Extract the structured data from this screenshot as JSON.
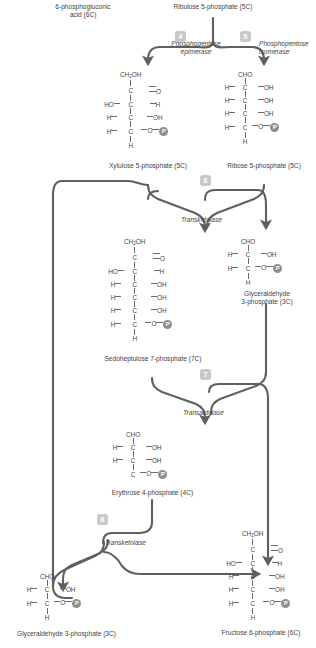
{
  "diagram": {
    "line_color": "#5f5f5f",
    "badge_color": "#c9c9c9",
    "phosphate_color": "#8d8d8d",
    "text_color": "#3f3f3f"
  },
  "labels": {
    "six_phosphogluconic": "6-phosphogluconic\nacid (6C)",
    "six_phosphogluconic_l1": "6-phosphogluconic",
    "six_phosphogluconic_l2": "acid (6C)",
    "ribulose5p": "Ribulose 5-phosphate (5C)",
    "xylulose5p": "Xylulose 5-phosphate (5C)",
    "ribose5p": "Ribose 5-phosphate (5C)",
    "sedoheptulose7p": "Sedoheptulose 7-phosphate (7C)",
    "glyceraldehyde3p_l1": "Glyceraldehyde",
    "glyceraldehyde3p_l2": "3-phosphate (3C)",
    "erythrose4p": "Erythrose 4-phosphate (4C)",
    "glyceraldehyde3p_bottom": "Glyceraldehyde 3-phosphate (3C)",
    "fructose6p": "Fructose 6-phosphate (6C)"
  },
  "enzymes": {
    "step4_l1": "Phosphopentose",
    "step4_l2": "epimerase",
    "step5_l1": "Phosphopentose",
    "step5_l2": "isomerase",
    "step6": "Transketolase",
    "step7": "Transaldolase",
    "step8": "Transketolase"
  },
  "badges": [
    {
      "num": "4",
      "x": 175,
      "y": 31
    },
    {
      "num": "5",
      "x": 240,
      "y": 31
    },
    {
      "num": "6",
      "x": 200,
      "y": 175
    },
    {
      "num": "7",
      "x": 200,
      "y": 369
    },
    {
      "num": "8",
      "x": 97,
      "y": 514
    }
  ],
  "phosphate_glyph": "P",
  "molecules": {
    "xylulose5p": {
      "name": "Xylulose 5-phosphate (5C)",
      "carbons": 5,
      "rows": [
        {
          "left": "",
          "center": "CH2OH",
          "right": "",
          "type": "head"
        },
        {
          "left": "",
          "center": "C",
          "right": "O",
          "bond": "double"
        },
        {
          "left": "HO",
          "center": "C",
          "right": "H",
          "bond": "single"
        },
        {
          "left": "H",
          "center": "C",
          "right": "OH",
          "bond": "single"
        },
        {
          "left": "H",
          "center": "C",
          "right": "O-P",
          "bond": "single"
        },
        {
          "left": "",
          "center": "H",
          "right": "",
          "type": "tail"
        }
      ]
    },
    "ribose5p": {
      "name": "Ribose 5-phosphate (5C)",
      "carbons": 5,
      "rows": [
        {
          "left": "",
          "center": "CHO",
          "right": "",
          "type": "head"
        },
        {
          "left": "H",
          "center": "C",
          "right": "OH",
          "bond": "single"
        },
        {
          "left": "H",
          "center": "C",
          "right": "OH",
          "bond": "single"
        },
        {
          "left": "H",
          "center": "C",
          "right": "OH",
          "bond": "single"
        },
        {
          "left": "H",
          "center": "C",
          "right": "O-P",
          "bond": "single"
        },
        {
          "left": "",
          "center": "H",
          "right": "",
          "type": "tail"
        }
      ]
    },
    "sedoheptulose7p": {
      "name": "Sedoheptulose 7-phosphate (7C)",
      "carbons": 7,
      "rows": [
        {
          "left": "",
          "center": "CH2OH",
          "right": "",
          "type": "head"
        },
        {
          "left": "",
          "center": "C",
          "right": "O",
          "bond": "double"
        },
        {
          "left": "HO",
          "center": "C",
          "right": "H",
          "bond": "single"
        },
        {
          "left": "H",
          "center": "C",
          "right": "OH",
          "bond": "single"
        },
        {
          "left": "H",
          "center": "C",
          "right": "OH",
          "bond": "single"
        },
        {
          "left": "H",
          "center": "C",
          "right": "OH",
          "bond": "single"
        },
        {
          "left": "H",
          "center": "C",
          "right": "O-P",
          "bond": "single"
        },
        {
          "left": "",
          "center": "H",
          "right": "",
          "type": "tail"
        }
      ]
    },
    "glyceraldehyde3p_right": {
      "name": "Glyceraldehyde 3-phosphate (3C)",
      "carbons": 3,
      "rows": [
        {
          "left": "",
          "center": "CHO",
          "right": "",
          "type": "head"
        },
        {
          "left": "H",
          "center": "C",
          "right": "OH",
          "bond": "single"
        },
        {
          "left": "H",
          "center": "C",
          "right": "O-P",
          "bond": "single"
        },
        {
          "left": "",
          "center": "H",
          "right": "",
          "type": "tail"
        }
      ]
    },
    "erythrose4p": {
      "name": "Erythrose 4-phosphate (4C)",
      "carbons": 4,
      "rows": [
        {
          "left": "",
          "center": "CHO",
          "right": "",
          "type": "head"
        },
        {
          "left": "H",
          "center": "C",
          "right": "OH",
          "bond": "single"
        },
        {
          "left": "H",
          "center": "C",
          "right": "OH",
          "bond": "single"
        },
        {
          "left": "",
          "center": "C",
          "right": "O-P",
          "bond": "single"
        }
      ]
    },
    "glyceraldehyde3p_bottom": {
      "name": "Glyceraldehyde 3-phosphate (3C)",
      "carbons": 3,
      "rows": [
        {
          "left": "",
          "center": "CHO",
          "right": "",
          "type": "head"
        },
        {
          "left": "H",
          "center": "C",
          "right": "OH",
          "bond": "single"
        },
        {
          "left": "H",
          "center": "C",
          "right": "O-P",
          "bond": "single"
        },
        {
          "left": "",
          "center": "H",
          "right": "",
          "type": "tail"
        }
      ]
    },
    "fructose6p": {
      "name": "Fructose 6-phosphate (6C)",
      "carbons": 6,
      "rows": [
        {
          "left": "",
          "center": "CH2OH",
          "right": "",
          "type": "head"
        },
        {
          "left": "",
          "center": "C",
          "right": "O",
          "bond": "double"
        },
        {
          "left": "HO",
          "center": "C",
          "right": "H",
          "bond": "single"
        },
        {
          "left": "H",
          "center": "C",
          "right": "OH",
          "bond": "single"
        },
        {
          "left": "H",
          "center": "C",
          "right": "OH",
          "bond": "single"
        },
        {
          "left": "H",
          "center": "C",
          "right": "O-P",
          "bond": "single"
        },
        {
          "left": "",
          "center": "H",
          "right": "",
          "type": "tail"
        }
      ]
    }
  }
}
